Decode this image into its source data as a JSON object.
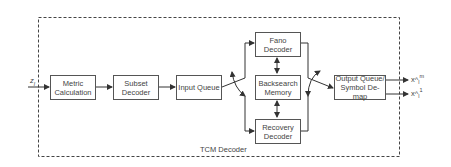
{
  "diagram": {
    "container_label": "TCM Decoder",
    "input_label": "z",
    "input_subscript": "l",
    "blocks": {
      "metric": "Metric Calculation",
      "subset": "Subset Decoder",
      "input_queue": "Input Queue",
      "fano": "Fano Decoder",
      "backsearch": "Backsearch Memory",
      "recovery": "Recovery Decoder",
      "output": "Output Queue/ Symbol De-map"
    },
    "outputs": [
      {
        "base": "x^",
        "sub": "l",
        "sup": "m"
      },
      {
        "base": "x^",
        "sub": "l",
        "sup": "1"
      }
    ],
    "colors": {
      "line": "#444444",
      "border": "#555555",
      "text": "#444444"
    }
  }
}
